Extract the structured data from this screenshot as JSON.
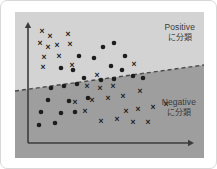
{
  "diagram": {
    "title_visible": false,
    "colors": {
      "card_background": "#ffffff",
      "card_border": "#d8d8d8",
      "positive_region": "#d3d3d3",
      "negative_region": "#9e9e9e",
      "axis": "#3b3b3b",
      "marker": "#1d1d1d",
      "boundary": "#4a4a4a",
      "label_text": "#3a3a3a"
    },
    "labels": {
      "positive": "Positive",
      "positive_ja": "に分類",
      "negative": "Negative",
      "negative_ja": "に分類"
    },
    "axes": {
      "x_axis": {
        "x1": 13,
        "y1": 131,
        "x2": 173,
        "y2": 131,
        "arrow": "right"
      },
      "y_axis": {
        "x1": 13,
        "y1": 131,
        "x2": 13,
        "y2": 16,
        "arrow": "up"
      }
    },
    "boundary_line": {
      "style": "dashed",
      "x1": 0,
      "y1": 79,
      "x2": 189,
      "y2": 53
    }
  },
  "chart_data": {
    "type": "scatter",
    "title": "",
    "xlabel": "",
    "ylabel": "",
    "grid": false,
    "legend_position": "none",
    "annotations": [
      {
        "text": "Positive に分類",
        "region": "above-boundary"
      },
      {
        "text": "Negative に分類",
        "region": "below-boundary"
      }
    ],
    "series": [
      {
        "name": "cross",
        "marker": "x",
        "points": [
          [
            27,
            19
          ],
          [
            35,
            24
          ],
          [
            53,
            22
          ],
          [
            25,
            31
          ],
          [
            33,
            35
          ],
          [
            42,
            33
          ],
          [
            29,
            45
          ],
          [
            44,
            44
          ],
          [
            55,
            32
          ],
          [
            28,
            55
          ],
          [
            57,
            53
          ],
          [
            82,
            63
          ],
          [
            119,
            52
          ],
          [
            72,
            74
          ],
          [
            85,
            76
          ],
          [
            98,
            74
          ],
          [
            60,
            90
          ],
          [
            77,
            88
          ],
          [
            93,
            86
          ],
          [
            108,
            84
          ],
          [
            125,
            79
          ],
          [
            70,
            99
          ],
          [
            111,
            99
          ],
          [
            123,
            97
          ],
          [
            86,
            109
          ],
          [
            102,
            107
          ],
          [
            138,
            95
          ],
          [
            151,
            92
          ],
          [
            118,
            110
          ],
          [
            133,
            110
          ]
        ]
      },
      {
        "name": "dot",
        "marker": "circle",
        "points": [
          [
            88,
            35
          ],
          [
            99,
            31
          ],
          [
            64,
            44
          ],
          [
            79,
            46
          ],
          [
            110,
            44
          ],
          [
            46,
            56
          ],
          [
            58,
            58
          ],
          [
            96,
            54
          ],
          [
            107,
            58
          ],
          [
            69,
            66
          ],
          [
            86,
            68
          ],
          [
            99,
            67
          ],
          [
            36,
            76
          ],
          [
            49,
            74
          ],
          [
            62,
            72
          ],
          [
            33,
            88
          ],
          [
            54,
            89
          ],
          [
            73,
            86
          ],
          [
            26,
            100
          ],
          [
            46,
            101
          ],
          [
            60,
            100
          ],
          [
            24,
            113
          ],
          [
            40,
            111
          ],
          [
            118,
            64
          ],
          [
            128,
            66
          ]
        ]
      }
    ]
  }
}
